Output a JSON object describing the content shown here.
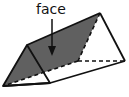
{
  "diagram": {
    "label": "face",
    "colors": {
      "face_fill": "#606060",
      "edge": "#111111",
      "background": "#ffffff"
    },
    "annotation": {
      "text": "face",
      "points_to": "shaded lateral face of prism"
    }
  }
}
